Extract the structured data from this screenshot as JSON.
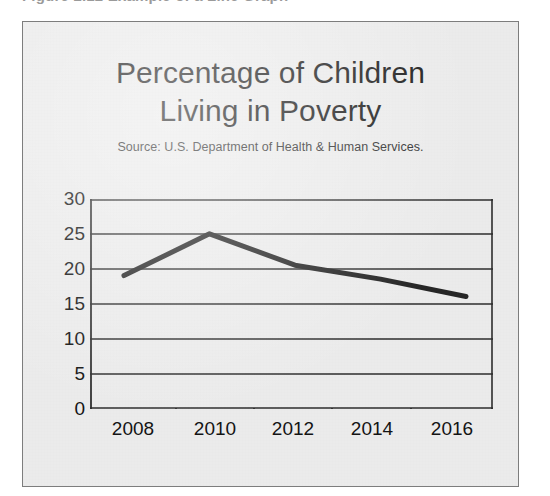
{
  "caption_remnant": "Figure 2.12  Example of a Line Graph",
  "figure": {
    "title_line_1": "Percentage of Children",
    "title_line_2": "Living in Poverty",
    "source": "Source: U.S. Department of Health & Human Services.",
    "background_color": "#ebebeb",
    "border_color": "#7d7d7d"
  },
  "chart_data": {
    "type": "line",
    "subtitle": "Source: U.S. Department of Health & Human Services.",
    "xlabel": "",
    "ylabel": "",
    "categories": [
      "2008",
      "2010",
      "2012",
      "2014",
      "2016"
    ],
    "values": [
      19,
      25,
      20.5,
      18.5,
      16
    ],
    "series": [
      {
        "name": "Percentage of children living in poverty",
        "values": [
          19,
          25,
          20.5,
          18.5,
          16
        ],
        "color": "#262626"
      }
    ],
    "ylim": [
      0,
      30
    ],
    "ytick_labels": [
      "30",
      "25",
      "20",
      "15",
      "10",
      "5",
      "0"
    ],
    "ytick_values": [
      30,
      25,
      20,
      15,
      10,
      5,
      0
    ],
    "xtick_labels": [
      "2008",
      "2010",
      "2012",
      "2014",
      "2016"
    ],
    "grid": true,
    "grid_axis": "y",
    "grid_color": "#2e2e2e",
    "legend": "none",
    "markers": false,
    "line_width": 5
  }
}
